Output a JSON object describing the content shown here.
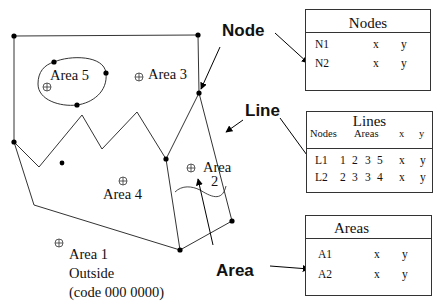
{
  "diagram": {
    "callouts": {
      "node": "Node",
      "line": "Line",
      "area": "Area"
    },
    "area_labels": {
      "area5": "Area 5",
      "area3": "Area 3",
      "area4": "Area 4",
      "area2_line1": "Area",
      "area2_line2": "2",
      "area1_line1": "Area 1",
      "area1_line2": "Outside",
      "area1_line3": "(code 000 0000)"
    },
    "centroid_symbol": "⊕"
  },
  "tables": {
    "nodes": {
      "title": "Nodes",
      "rows": [
        {
          "id": "N1",
          "x": "x",
          "y": "y"
        },
        {
          "id": "N2",
          "x": "x",
          "y": "y"
        }
      ]
    },
    "lines": {
      "title": "Lines",
      "headers": {
        "nodes": "Nodes",
        "areas": "Areas",
        "x": "x",
        "y": "y"
      },
      "rows": [
        {
          "id": "L1",
          "n1": "1",
          "n2": "2",
          "a1": "3",
          "a2": "5",
          "x": "x",
          "y": "y"
        },
        {
          "id": "L2",
          "n1": "2",
          "n2": "3",
          "a1": "3",
          "a2": "4",
          "x": "x",
          "y": "y"
        }
      ]
    },
    "areas": {
      "title": "Areas",
      "rows": [
        {
          "id": "A1",
          "x": "x",
          "y": "y"
        },
        {
          "id": "A2",
          "x": "x",
          "y": "y"
        }
      ]
    }
  },
  "colors": {
    "stroke": "#333333",
    "node": "#000000",
    "background": "#ffffff"
  }
}
